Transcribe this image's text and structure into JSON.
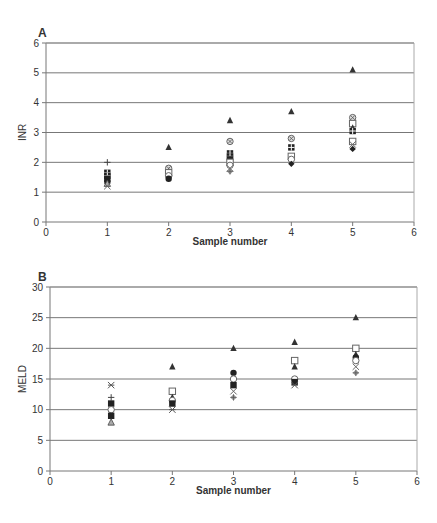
{
  "chart_data": [
    {
      "type": "scatter",
      "panel_label": "A",
      "title": "",
      "xlabel": "Sample number",
      "ylabel": "INR",
      "xlim": [
        0,
        6
      ],
      "ylim": [
        0,
        6
      ],
      "xticks": [
        "0",
        "1",
        "2",
        "3",
        "4",
        "5",
        "6"
      ],
      "yticks": [
        "0",
        "1",
        "2",
        "3",
        "4",
        "5",
        "6"
      ],
      "grid": "horizontal",
      "points": [
        {
          "x": 1,
          "y": 2.0,
          "marker": "plus"
        },
        {
          "x": 1,
          "y": 1.65,
          "marker": "grid-square"
        },
        {
          "x": 1,
          "y": 1.55,
          "marker": "grid-square"
        },
        {
          "x": 1,
          "y": 1.45,
          "marker": "filled-square"
        },
        {
          "x": 1,
          "y": 1.35,
          "marker": "filled-circle"
        },
        {
          "x": 1,
          "y": 1.3,
          "marker": "triangle-open"
        },
        {
          "x": 1,
          "y": 1.2,
          "marker": "x"
        },
        {
          "x": 2,
          "y": 2.5,
          "marker": "filled-triangle"
        },
        {
          "x": 2,
          "y": 1.8,
          "marker": "circle-x"
        },
        {
          "x": 2,
          "y": 1.65,
          "marker": "open-square"
        },
        {
          "x": 2,
          "y": 1.55,
          "marker": "open-circle"
        },
        {
          "x": 2,
          "y": 1.45,
          "marker": "filled-circle"
        },
        {
          "x": 3,
          "y": 3.4,
          "marker": "filled-triangle"
        },
        {
          "x": 3,
          "y": 2.7,
          "marker": "circle-x"
        },
        {
          "x": 3,
          "y": 2.3,
          "marker": "grid-square"
        },
        {
          "x": 3,
          "y": 2.2,
          "marker": "grid-square"
        },
        {
          "x": 3,
          "y": 2.1,
          "marker": "filled-square"
        },
        {
          "x": 3,
          "y": 2.0,
          "marker": "open-square"
        },
        {
          "x": 3,
          "y": 1.9,
          "marker": "open-circle"
        },
        {
          "x": 3,
          "y": 1.8,
          "marker": "x"
        },
        {
          "x": 3,
          "y": 1.7,
          "marker": "diamond-plus"
        },
        {
          "x": 4,
          "y": 3.7,
          "marker": "filled-triangle"
        },
        {
          "x": 4,
          "y": 2.8,
          "marker": "circle-x"
        },
        {
          "x": 4,
          "y": 2.5,
          "marker": "grid-square"
        },
        {
          "x": 4,
          "y": 2.2,
          "marker": "open-square"
        },
        {
          "x": 4,
          "y": 2.1,
          "marker": "open-circle"
        },
        {
          "x": 4,
          "y": 1.95,
          "marker": "filled-diamond"
        },
        {
          "x": 5,
          "y": 5.1,
          "marker": "filled-triangle"
        },
        {
          "x": 5,
          "y": 3.5,
          "marker": "circle-x"
        },
        {
          "x": 5,
          "y": 3.3,
          "marker": "open-square"
        },
        {
          "x": 5,
          "y": 3.15,
          "marker": "filled-triangle"
        },
        {
          "x": 5,
          "y": 3.05,
          "marker": "grid-square"
        },
        {
          "x": 5,
          "y": 2.7,
          "marker": "open-square"
        },
        {
          "x": 5,
          "y": 2.6,
          "marker": "x"
        },
        {
          "x": 5,
          "y": 2.45,
          "marker": "filled-diamond"
        }
      ]
    },
    {
      "type": "scatter",
      "panel_label": "B",
      "title": "",
      "xlabel": "Sample number",
      "ylabel": "MELD",
      "xlim": [
        0,
        6
      ],
      "ylim": [
        0,
        30
      ],
      "xticks": [
        "0",
        "1",
        "2",
        "3",
        "4",
        "5",
        "6"
      ],
      "yticks": [
        "0",
        "5",
        "10",
        "15",
        "20",
        "25",
        "30"
      ],
      "grid": "horizontal",
      "points": [
        {
          "x": 1,
          "y": 14,
          "marker": "asterisk"
        },
        {
          "x": 1,
          "y": 12,
          "marker": "plus"
        },
        {
          "x": 1,
          "y": 11,
          "marker": "filled-square"
        },
        {
          "x": 1,
          "y": 10,
          "marker": "open-circle"
        },
        {
          "x": 1,
          "y": 9,
          "marker": "filled-square"
        },
        {
          "x": 1,
          "y": 8,
          "marker": "triangle-open"
        },
        {
          "x": 2,
          "y": 17,
          "marker": "filled-triangle"
        },
        {
          "x": 2,
          "y": 13,
          "marker": "open-square"
        },
        {
          "x": 2,
          "y": 12,
          "marker": "filled-triangle"
        },
        {
          "x": 2,
          "y": 11.5,
          "marker": "open-circle"
        },
        {
          "x": 2,
          "y": 11,
          "marker": "filled-square"
        },
        {
          "x": 2,
          "y": 10,
          "marker": "asterisk"
        },
        {
          "x": 3,
          "y": 20,
          "marker": "filled-triangle"
        },
        {
          "x": 3,
          "y": 16,
          "marker": "filled-circle"
        },
        {
          "x": 3,
          "y": 15,
          "marker": "open-circle"
        },
        {
          "x": 3,
          "y": 14,
          "marker": "filled-square"
        },
        {
          "x": 3,
          "y": 13,
          "marker": "x"
        },
        {
          "x": 3,
          "y": 12,
          "marker": "diamond-plus"
        },
        {
          "x": 4,
          "y": 21,
          "marker": "filled-triangle"
        },
        {
          "x": 4,
          "y": 18,
          "marker": "open-square"
        },
        {
          "x": 4,
          "y": 17,
          "marker": "filled-triangle"
        },
        {
          "x": 4,
          "y": 15,
          "marker": "open-circle"
        },
        {
          "x": 4,
          "y": 14.5,
          "marker": "filled-square"
        },
        {
          "x": 4,
          "y": 14,
          "marker": "asterisk"
        },
        {
          "x": 5,
          "y": 25,
          "marker": "filled-triangle"
        },
        {
          "x": 5,
          "y": 20,
          "marker": "open-square"
        },
        {
          "x": 5,
          "y": 19,
          "marker": "filled-triangle"
        },
        {
          "x": 5,
          "y": 18.5,
          "marker": "filled-circle"
        },
        {
          "x": 5,
          "y": 18,
          "marker": "open-circle"
        },
        {
          "x": 5,
          "y": 17,
          "marker": "x"
        },
        {
          "x": 5,
          "y": 16,
          "marker": "diamond-plus"
        }
      ]
    }
  ],
  "panels": {
    "a": {
      "label": "A",
      "ylabel": "INR",
      "xlabel": "Sample number"
    },
    "b": {
      "label": "B",
      "ylabel": "MELD",
      "xlabel": "Sample number"
    }
  }
}
